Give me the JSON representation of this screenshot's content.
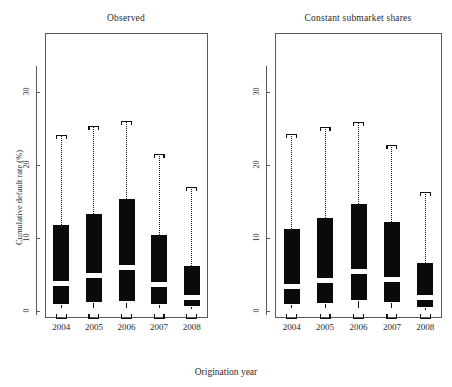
{
  "figure": {
    "xlabel": "Origination year",
    "ylabel": "Cumulative default rate (%)",
    "yticks": [
      "0",
      "10",
      "20",
      "30"
    ],
    "xticks": [
      "2004",
      "2005",
      "2006",
      "2007",
      "2008"
    ],
    "panels": [
      {
        "title": "Observed"
      },
      {
        "title": "Constant submarket shares"
      }
    ]
  },
  "chart_data": [
    {
      "type": "box",
      "title": "Observed",
      "xlabel": "Origination year",
      "ylabel": "Cumulative default rate (%)",
      "categories": [
        "2004",
        "2005",
        "2006",
        "2007",
        "2008"
      ],
      "ylim": [
        0,
        35
      ],
      "yticks": [
        0,
        10,
        20,
        30
      ],
      "grid": false,
      "legend": "none",
      "boxes": [
        {
          "category": "2004",
          "lower_whisker": 0.0,
          "q1": 0.9,
          "median": 3.7,
          "q3": 11.8,
          "upper_whisker": 24.1
        },
        {
          "category": "2005",
          "lower_whisker": 0.0,
          "q1": 1.2,
          "median": 4.8,
          "q3": 13.3,
          "upper_whisker": 25.4
        },
        {
          "category": "2006",
          "lower_whisker": 0.0,
          "q1": 1.3,
          "median": 5.9,
          "q3": 15.3,
          "upper_whisker": 26.0
        },
        {
          "category": "2007",
          "lower_whisker": 0.0,
          "q1": 0.9,
          "median": 3.6,
          "q3": 10.4,
          "upper_whisker": 21.5
        },
        {
          "category": "2008",
          "lower_whisker": 0.0,
          "q1": 0.7,
          "median": 1.8,
          "q3": 6.1,
          "upper_whisker": 17.0
        }
      ]
    },
    {
      "type": "box",
      "title": "Constant submarket shares",
      "xlabel": "Origination year",
      "ylabel": "Cumulative default rate (%)",
      "categories": [
        "2004",
        "2005",
        "2006",
        "2007",
        "2008"
      ],
      "ylim": [
        0,
        35
      ],
      "yticks": [
        0,
        10,
        20,
        30
      ],
      "grid": false,
      "legend": "none",
      "boxes": [
        {
          "category": "2004",
          "lower_whisker": 0.0,
          "q1": 1.0,
          "median": 3.4,
          "q3": 11.3,
          "upper_whisker": 24.3
        },
        {
          "category": "2005",
          "lower_whisker": 0.0,
          "q1": 1.1,
          "median": 4.2,
          "q3": 12.7,
          "upper_whisker": 25.2
        },
        {
          "category": "2006",
          "lower_whisker": 0.0,
          "q1": 1.5,
          "median": 5.4,
          "q3": 14.6,
          "upper_whisker": 25.9
        },
        {
          "category": "2007",
          "lower_whisker": 0.0,
          "q1": 1.2,
          "median": 4.3,
          "q3": 12.2,
          "upper_whisker": 22.8
        },
        {
          "category": "2008",
          "lower_whisker": 0.0,
          "q1": 0.6,
          "median": 1.8,
          "q3": 6.6,
          "upper_whisker": 16.3
        }
      ]
    }
  ],
  "style": {
    "box_color": "#0a0a0a",
    "median_color": "#ffffff",
    "frame_color": "#5a5a5a",
    "whisker_color": "#111111",
    "background": "#ffffff"
  }
}
